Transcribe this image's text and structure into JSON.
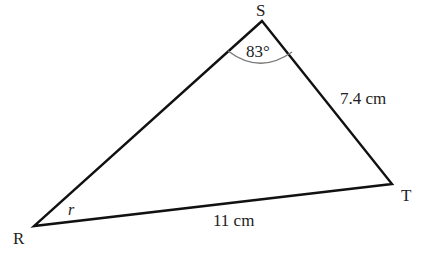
{
  "diagram": {
    "type": "triangle",
    "vertices": [
      {
        "name": "S",
        "x": 262,
        "y": 21
      },
      {
        "name": "R",
        "x": 34,
        "y": 226
      },
      {
        "name": "T",
        "x": 392,
        "y": 184
      }
    ],
    "labels": {
      "S": "S",
      "R": "R",
      "T": "T"
    },
    "angle_S": "83°",
    "angle_R": "r",
    "side_ST": "7.4 cm",
    "side_RT": "11 cm",
    "colors": {
      "line": "#111111",
      "arc": "#777777",
      "text": "#222222"
    }
  }
}
